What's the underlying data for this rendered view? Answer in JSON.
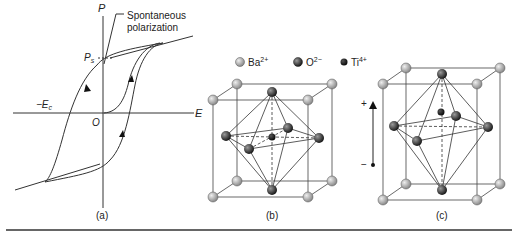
{
  "panel_a": {
    "y_axis_label": "P",
    "x_axis_label": "E",
    "origin_label": "O",
    "ps_label": "P",
    "ps_sub": "s",
    "ec_label": "−E",
    "ec_sub": "c",
    "annotation_line1": "Spontaneous",
    "annotation_line2": "polarization",
    "caption": "(a)"
  },
  "legend": {
    "items": [
      {
        "ion": "Ba",
        "charge": "2+",
        "color": "#b8b8b8"
      },
      {
        "ion": "O",
        "charge": "2−",
        "color": "#555555"
      },
      {
        "ion": "Ti",
        "charge": "4+",
        "color": "#222222"
      }
    ]
  },
  "panel_b": {
    "caption": "(b)"
  },
  "panel_c": {
    "caption": "(c)",
    "plus_label": "+",
    "minus_label": "−"
  },
  "colors": {
    "line": "#333333",
    "ba": "#b8b8b8",
    "o": "#4a4a4a",
    "ti": "#1e1e1e"
  }
}
